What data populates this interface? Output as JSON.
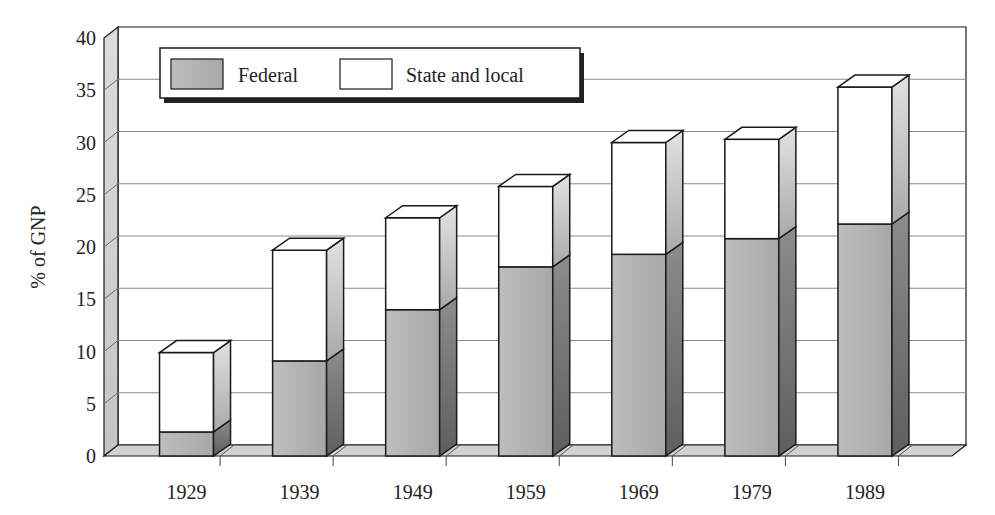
{
  "chart_data": {
    "type": "bar",
    "subtype": "stacked-3d",
    "title": "",
    "xlabel": "",
    "ylabel": "% of GNP",
    "ylim": [
      0,
      40
    ],
    "yticks": [
      0,
      5,
      10,
      15,
      20,
      25,
      30,
      35,
      40
    ],
    "grid": true,
    "legend_position": "top-left-inside",
    "categories": [
      "1929",
      "1939",
      "1949",
      "1959",
      "1969",
      "1979",
      "1989"
    ],
    "series": [
      {
        "name": "Federal",
        "values": [
          2.3,
          9.1,
          14.0,
          18.1,
          19.3,
          20.8,
          22.2
        ]
      },
      {
        "name": "State and local",
        "values": [
          7.6,
          10.6,
          8.8,
          7.7,
          10.7,
          9.5,
          13.1
        ]
      }
    ],
    "totals": [
      9.9,
      19.7,
      22.8,
      25.8,
      30.0,
      30.3,
      35.3
    ]
  },
  "legend": {
    "federal_label": "Federal",
    "state_label": "State and local"
  },
  "colors": {
    "federal_front": "#b4b4b4",
    "federal_side": "#7a7a7a",
    "state_front": "#ffffff",
    "state_side": "#c8c8c8",
    "wall": "#d6d6d6",
    "gridline": "#8a8a8a",
    "outline": "#1a1a1a"
  }
}
